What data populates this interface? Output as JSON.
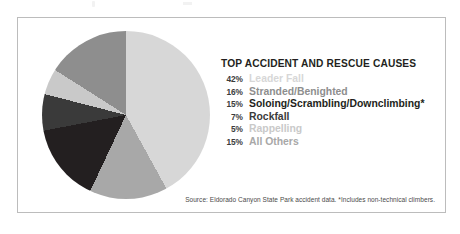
{
  "panel": {
    "border_color": "#bcbcbc",
    "background": "#ffffff"
  },
  "legend": {
    "title": "TOP ACCIDENT AND RESCUE CAUSES"
  },
  "source": {
    "text": "Source: Eldorado Canyon State Park accident data. *Includes non-technical climbers."
  },
  "chart_data": {
    "type": "pie",
    "title": "TOP ACCIDENT AND RESCUE CAUSES",
    "xlabel": "",
    "ylabel": "",
    "units": "percent",
    "total": 100,
    "start_angle_deg": 0,
    "direction": "clockwise",
    "legend_position": "right",
    "grid": false,
    "note": "Source: Eldorado Canyon State Park accident data. *Includes non-technical climbers.",
    "categories": [
      "Leader Fall",
      "Stranded/Benighted",
      "Soloing/Scrambling/Downclimbing*",
      "Rockfall",
      "Rappelling",
      "All Others"
    ],
    "values": [
      42,
      16,
      15,
      7,
      5,
      15
    ],
    "labels": [
      "42%",
      "16%",
      "15%",
      "7%",
      "5%",
      "15%"
    ],
    "colors": [
      "#d7d7d7",
      "#8e8e8e",
      "#231f20",
      "#3a3a3a",
      "#c9c9c9",
      "#a8a8a8"
    ],
    "slices": [
      {
        "label": "Leader Fall",
        "pct": 42,
        "pct_label": "42%",
        "color": "#d7d7d7"
      },
      {
        "label": "Stranded/Benighted",
        "pct": 16,
        "pct_label": "16%",
        "color": "#8e8e8e"
      },
      {
        "label": "Soloing/Scrambling/Downclimbing*",
        "pct": 15,
        "pct_label": "15%",
        "color": "#231f20"
      },
      {
        "label": "Rockfall",
        "pct": 7,
        "pct_label": "7%",
        "color": "#3a3a3a"
      },
      {
        "label": "Rappelling",
        "pct": 5,
        "pct_label": "5%",
        "color": "#c9c9c9"
      },
      {
        "label": "All Others",
        "pct": 15,
        "pct_label": "15%",
        "color": "#a8a8a8"
      }
    ],
    "draw_order_clockwise": [
      "Leader Fall",
      "All Others",
      "Soloing/Scrambling/Downclimbing*",
      "Rockfall",
      "Rappelling",
      "Stranded/Benighted"
    ]
  }
}
